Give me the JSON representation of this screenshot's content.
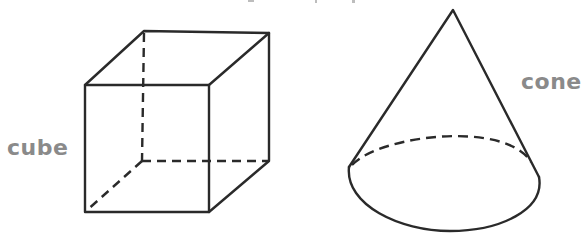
{
  "figure": {
    "type": "geometric-solids",
    "stroke_color": "#2a2a2a",
    "label_color": "#8a8a8a",
    "shapes": [
      {
        "name": "cube",
        "label": "cube",
        "visible_edges": [
          [
            85,
            85,
            209,
            85
          ],
          [
            209,
            85,
            209,
            212
          ],
          [
            209,
            212,
            85,
            212
          ],
          [
            85,
            212,
            85,
            85
          ],
          [
            85,
            85,
            144,
            31
          ],
          [
            144,
            31,
            269,
            33
          ],
          [
            269,
            33,
            209,
            85
          ],
          [
            269,
            33,
            269,
            161
          ],
          [
            269,
            161,
            209,
            212
          ]
        ],
        "hidden_edges": [
          [
            144,
            31,
            142,
            161
          ],
          [
            142,
            161,
            269,
            161
          ],
          [
            142,
            161,
            85,
            212
          ]
        ]
      },
      {
        "name": "cone",
        "label": "cone",
        "apex": [
          453,
          10
        ],
        "base_ellipse": {
          "cx": 444,
          "cy": 180,
          "rx": 95,
          "ry": 50
        }
      }
    ]
  }
}
